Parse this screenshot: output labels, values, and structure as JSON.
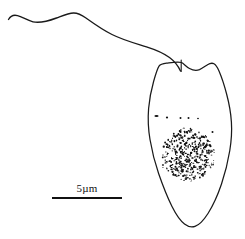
{
  "figure": {
    "kind": "scientific-line-drawing",
    "background_color": "#ffffff",
    "ink_color": "#1a1a1a"
  },
  "scale_bar": {
    "label": "5µm",
    "value": 5,
    "unit": "µm",
    "x_start": 52,
    "x_end": 122,
    "y": 198,
    "thickness": 2.2,
    "color": "#111111"
  },
  "cell_body": {
    "name": "cell-outline",
    "bbox": {
      "x": 148,
      "y": 60,
      "width": 84,
      "height": 168
    },
    "shape": "ovoid-pyriform-with-notched-apex",
    "path": "M 181.5 62.5 C 177 61.6 171.5 62.6 166.5 63.2 C 162.5 63.6 160.2 64.4 159.0 66.2 C 157.2 69.0 155.6 74.5 153.6 81.5 C 151.2 90.0 149.4 99.0 148.6 108.5 C 147.8 118.5 148.2 129.0 150.0 139.5 C 152.0 151.5 155.0 163.0 158.6 173.5 C 162.6 185.0 167.0 196.5 172.0 206.5 C 176.0 214.5 180.0 220.5 184.5 224.0 C 188.0 226.7 191.6 227.6 195.0 226.4 C 199.0 225.0 203.5 220.5 208.0 213.5 C 213.0 205.5 217.8 195.0 221.5 184.0 C 225.2 173.0 228.0 161.5 229.8 150.5 C 231.4 140.5 232.0 131.0 231.4 122.0 C 230.8 112.5 229.0 103.0 226.6 94.0 C 224.4 85.5 221.8 77.5 219.0 71.0 C 217.4 67.2 215.8 64.8 214.0 63.8 C 212.2 62.8 210.0 63.2 207.5 64.8 C 205.0 66.4 202.0 68.5 199.5 69.6 C 196.5 70.8 193.0 70.4 189.5 68.5 C 186.0 66.6 183.6 63.4 181.5 62.5 Z"
  },
  "flagellum": {
    "name": "flagellum",
    "description": "single long anterior flagellum sweeping left",
    "path": "M 8.5 19.5 C 10.5 16.0 13.5 14.5 17.5 15.6 C 22.5 17.0 27.5 20.5 33.0 21.8 C 40.0 23.4 48.5 21.0 56.5 18.0 C 63.0 15.6 68.5 13.2 73.5 13.0 C 78.0 12.9 81.5 14.8 86.0 18.0 C 93.0 23.0 102.0 29.5 112.0 34.5 C 124.0 40.5 136.0 43.5 146.5 46.8 C 156.0 49.8 163.5 53.0 169.5 57.5 C 175.0 61.6 178.5 66.5 180.5 71.0",
    "tip": {
      "x": 8.5,
      "y": 19.5
    },
    "insertion": {
      "x": 181,
      "y": 71
    }
  },
  "apical_slit": {
    "name": "flagellar-insertion-slit",
    "x": 181.2,
    "y_start": 60.0,
    "y_end": 71.5
  },
  "speck_row": {
    "name": "cytoplasmic-specks",
    "dots": [
      {
        "x": 156.5,
        "y": 116.0,
        "rx": 2.1,
        "ry": 0.9
      },
      {
        "x": 167.0,
        "y": 117.5,
        "rx": 1.1,
        "ry": 1.0
      },
      {
        "x": 180.5,
        "y": 118.0,
        "rx": 1.0,
        "ry": 0.9
      },
      {
        "x": 188.5,
        "y": 118.0,
        "rx": 1.0,
        "ry": 0.9
      },
      {
        "x": 198.0,
        "y": 118.5,
        "rx": 0.9,
        "ry": 0.8
      },
      {
        "x": 212.5,
        "y": 132.0,
        "rx": 1.0,
        "ry": 0.9
      }
    ]
  },
  "granular_mass": {
    "name": "granular-inclusion-body",
    "description": "dense stippled rounded mass (nucleus / reserve granules)",
    "center": {
      "x": 188,
      "y": 155
    },
    "radius_x": 27,
    "radius_y": 26,
    "granule_count": 430,
    "granule_color": "#111111"
  }
}
